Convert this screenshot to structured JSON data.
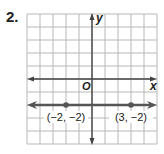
{
  "problem_number": "2.",
  "chart_data": {
    "type": "line",
    "title": "",
    "xlabel": "x",
    "ylabel": "y",
    "origin_label": "O",
    "xlim": [
      -5,
      5
    ],
    "ylim": [
      -5,
      5
    ],
    "grid": true,
    "series": [
      {
        "name": "y = -2",
        "kind": "horizontal line with arrows",
        "points": [
          {
            "x": -2,
            "y": -2,
            "label": "(−2, −2)"
          },
          {
            "x": 3,
            "y": -2,
            "label": "(3, −2)"
          }
        ]
      }
    ]
  },
  "colors": {
    "grid": "#b8b8b8",
    "axis": "#444444",
    "line": "#555555",
    "point": "#555555",
    "text": "#222222"
  }
}
